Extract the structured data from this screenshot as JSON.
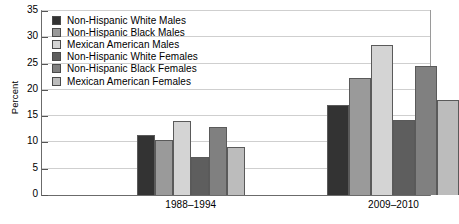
{
  "chart_data": {
    "type": "bar",
    "title": "",
    "xlabel": "",
    "ylabel": "Percent",
    "ylim": [
      0,
      35
    ],
    "ytick_step": 5,
    "yticks": [
      0,
      5,
      10,
      15,
      20,
      25,
      30,
      35
    ],
    "ytick_labels": [
      "0",
      "5",
      "10",
      "15",
      "20",
      "25",
      "30",
      "35"
    ],
    "grid": true,
    "grid_axis": "y",
    "legend_position": "upper-left-inside",
    "categories": [
      "1988–1994",
      "2009–2010"
    ],
    "series": [
      {
        "name": "Non-Hispanic White Males",
        "color": "#333333",
        "values": [
          11.5,
          17.2
        ]
      },
      {
        "name": "Non-Hispanic Black Males",
        "color": "#9a9a9a",
        "values": [
          10.5,
          22.3
        ]
      },
      {
        "name": "Mexican American Males",
        "color": "#d4d4d4",
        "values": [
          14.0,
          28.5
        ]
      },
      {
        "name": "Non-Hispanic White Females",
        "color": "#5e5e5e",
        "values": [
          7.3,
          14.2
        ]
      },
      {
        "name": "Non-Hispanic Black Females",
        "color": "#808080",
        "values": [
          13.0,
          24.5
        ]
      },
      {
        "name": "Mexican American Females",
        "color": "#bcbcbc",
        "values": [
          9.2,
          18.1
        ]
      }
    ]
  },
  "axis": {
    "y_title": "Percent"
  },
  "colors": {
    "gridline": "#cfcfcf",
    "axis": "#6b6b6b",
    "bar_outline": "#5a5a5a",
    "background": "#ffffff",
    "text": "#000000"
  }
}
